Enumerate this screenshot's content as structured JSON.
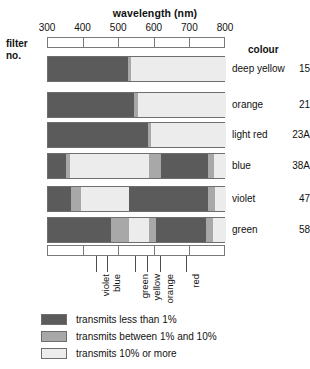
{
  "chart_data": {
    "type": "bar",
    "title": "wavelength (nm)",
    "xlabel": "wavelength (nm)",
    "ylabel": "filter no.",
    "xlim": [
      300,
      800
    ],
    "xticks": [
      300,
      400,
      500,
      600,
      700,
      800
    ],
    "xtick_labels": [
      "300",
      "400",
      "500",
      "600",
      "700",
      "800"
    ],
    "grid": false,
    "legend_position": "bottom-left",
    "row_header_left": "filter\nno.",
    "row_header_right": "colour",
    "levels": [
      {
        "key": "low",
        "label": "transmits less than 1%",
        "color": "#5b5b5b"
      },
      {
        "key": "mid",
        "label": "transmits between 1% and 10%",
        "color": "#a8a8a8"
      },
      {
        "key": "high",
        "label": "transmits 10% or more",
        "color": "#ececec"
      }
    ],
    "colour_bands": [
      {
        "label": "violet",
        "wavelength": 438
      },
      {
        "label": "blue",
        "wavelength": 469
      },
      {
        "label": "green",
        "wavelength": 547
      },
      {
        "label": "yellow",
        "wavelength": 581
      },
      {
        "label": "orange",
        "wavelength": 617
      },
      {
        "label": "red",
        "wavelength": 690
      }
    ],
    "rows": [
      {
        "filter_no": "15",
        "colour": "deep yellow",
        "segments": [
          {
            "from": 300,
            "to": 525,
            "level": "low"
          },
          {
            "from": 525,
            "to": 534,
            "level": "mid"
          },
          {
            "from": 534,
            "to": 800,
            "level": "high"
          }
        ]
      },
      {
        "filter_no": "21",
        "colour": "orange",
        "segments": [
          {
            "from": 300,
            "to": 542,
            "level": "low"
          },
          {
            "from": 542,
            "to": 553,
            "level": "mid"
          },
          {
            "from": 553,
            "to": 800,
            "level": "high"
          }
        ]
      },
      {
        "filter_no": "23A",
        "colour": "light red",
        "segments": [
          {
            "from": 300,
            "to": 581,
            "level": "low"
          },
          {
            "from": 581,
            "to": 590,
            "level": "mid"
          },
          {
            "from": 590,
            "to": 800,
            "level": "high"
          }
        ]
      },
      {
        "filter_no": "38A",
        "colour": "blue",
        "segments": [
          {
            "from": 300,
            "to": 351,
            "level": "low"
          },
          {
            "from": 351,
            "to": 362,
            "level": "mid"
          },
          {
            "from": 362,
            "to": 584,
            "level": "high"
          },
          {
            "from": 584,
            "to": 618,
            "level": "mid"
          },
          {
            "from": 618,
            "to": 750,
            "level": "low"
          },
          {
            "from": 750,
            "to": 767,
            "level": "mid"
          },
          {
            "from": 767,
            "to": 800,
            "level": "high"
          }
        ]
      },
      {
        "filter_no": "47",
        "colour": "violet",
        "segments": [
          {
            "from": 300,
            "to": 365,
            "level": "low"
          },
          {
            "from": 365,
            "to": 393,
            "level": "mid"
          },
          {
            "from": 393,
            "to": 528,
            "level": "high"
          },
          {
            "from": 528,
            "to": 750,
            "level": "low"
          },
          {
            "from": 750,
            "to": 770,
            "level": "mid"
          },
          {
            "from": 770,
            "to": 800,
            "level": "high"
          }
        ]
      },
      {
        "filter_no": "58",
        "colour": "green",
        "segments": [
          {
            "from": 300,
            "to": 477,
            "level": "low"
          },
          {
            "from": 477,
            "to": 528,
            "level": "mid"
          },
          {
            "from": 528,
            "to": 584,
            "level": "high"
          },
          {
            "from": 584,
            "to": 604,
            "level": "mid"
          },
          {
            "from": 604,
            "to": 744,
            "level": "low"
          },
          {
            "from": 744,
            "to": 764,
            "level": "mid"
          },
          {
            "from": 764,
            "to": 800,
            "level": "high"
          }
        ]
      }
    ]
  }
}
